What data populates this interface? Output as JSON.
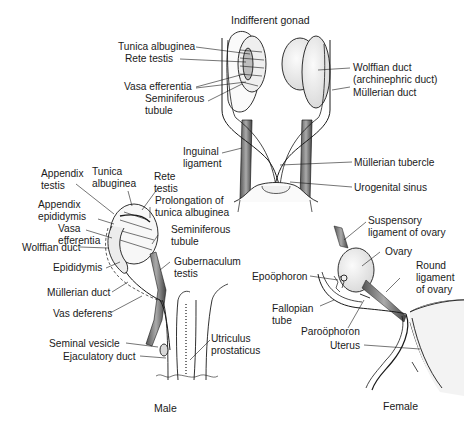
{
  "figure": {
    "panels": {
      "indifferent": {
        "title": "Indifferent gonad",
        "labels": {
          "tunica_albuginea": "Tunica albuginea",
          "rete_testis": "Rete testis",
          "vasa_efferentia": "Vasa efferentia",
          "seminiferous_1": "Seminiferous",
          "seminiferous_2": "tubule",
          "wolffian_1": "Wolffian duct",
          "wolffian_2": "(archinephric duct)",
          "mullerian_duct": "Müllerian duct",
          "inguinal_1": "Inguinal",
          "inguinal_2": "ligament",
          "mullerian_tubercle": "Müllerian tubercle",
          "urogenital_sinus": "Urogenital sinus"
        }
      },
      "male": {
        "title": "Male",
        "labels": {
          "appendix_testis_1": "Appendix",
          "appendix_testis_2": "testis",
          "tunica_1": "Tunica",
          "tunica_2": "albuginea",
          "rete_1": "Rete",
          "rete_2": "testis",
          "prolongation_1": "Prolongation of",
          "prolongation_2": "tunica albuginea",
          "appendix_epid_1": "Appendix",
          "appendix_epid_2": "epididymis",
          "vasa_1": "Vasa",
          "vasa_2": "efferentia",
          "wolffian_duct": "Wolffian duct",
          "seminiferous_1": "Seminiferous",
          "seminiferous_2": "tubule",
          "epididymis": "Epididymis",
          "gubernaculum_1": "Gubernaculum",
          "gubernaculum_2": "testis",
          "mullerian_duct": "Müllerian duct",
          "vas_deferens": "Vas deferens",
          "seminal_vesicle": "Seminal vesicle",
          "ejaculatory_duct": "Ejaculatory duct",
          "utriculus_1": "Utriculus",
          "utriculus_2": "prostaticus"
        }
      },
      "female": {
        "title": "Female",
        "labels": {
          "suspensory_1": "Suspensory",
          "suspensory_2": "ligament of ovary",
          "ovary": "Ovary",
          "round_1": "Round",
          "round_2": "ligament",
          "round_3": "of ovary",
          "epoophoron": "Epoöphoron",
          "fallopian_1": "Fallopian",
          "fallopian_2": "tube",
          "paroophoron": "Paroöphoron",
          "uterus": "Uterus"
        }
      }
    },
    "colors": {
      "ink": "#1a1a1a",
      "fill": "#f2f2f2",
      "shade": "#d9d9d9"
    }
  }
}
